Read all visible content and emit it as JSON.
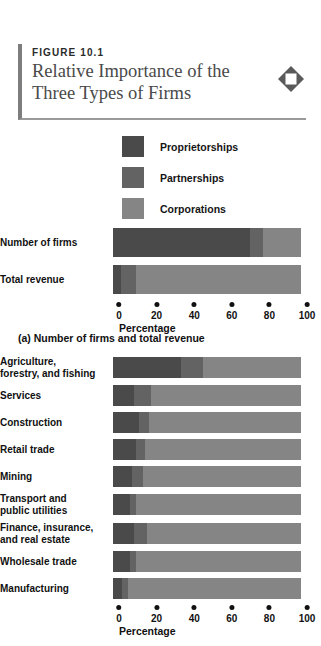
{
  "figure": {
    "label": "FIGURE 10.1",
    "title_line1": "Relative Importance of the",
    "title_line2": "Three Types of Firms",
    "icon": "diamond-icon"
  },
  "colors": {
    "proprietorships": "#4a4a4a",
    "partnerships": "#636363",
    "corporations": "#858585",
    "rule": "#7d7d7d",
    "text": "#111111"
  },
  "legend": {
    "items": [
      {
        "label": "Proprietorships",
        "color": "#4a4a4a"
      },
      {
        "label": "Partnerships",
        "color": "#636363"
      },
      {
        "label": "Corporations",
        "color": "#858585"
      }
    ]
  },
  "axis": {
    "ticks": [
      "0",
      "20",
      "40",
      "60",
      "80",
      "100"
    ],
    "tick_values": [
      0,
      20,
      40,
      60,
      80,
      100
    ],
    "title": "Percentage",
    "min": 0,
    "max": 100
  },
  "panel_a": {
    "caption": "(a) Number of firms and total revenue"
  },
  "chart_data": [
    {
      "type": "bar",
      "orientation": "horizontal",
      "stacked": true,
      "title": "(a) Number of firms and total revenue",
      "xlabel": "Percentage",
      "ylabel": "",
      "xlim": [
        0,
        100
      ],
      "grid": false,
      "legend_position": "top",
      "categories": [
        "Number of firms",
        "Total revenue"
      ],
      "series": [
        {
          "name": "Proprietorships",
          "values": [
            73,
            4
          ]
        },
        {
          "name": "Partnerships",
          "values": [
            7,
            8
          ]
        },
        {
          "name": "Corporations",
          "values": [
            20,
            88
          ]
        }
      ]
    },
    {
      "type": "bar",
      "orientation": "horizontal",
      "stacked": true,
      "title": "",
      "xlabel": "Percentage",
      "ylabel": "",
      "xlim": [
        0,
        100
      ],
      "grid": false,
      "legend_position": "top",
      "categories": [
        "Agriculture,\nforestry, and fishing",
        "Services",
        "Construction",
        "Retail trade",
        "Mining",
        "Transport and\npublic utilities",
        "Finance, insurance,\nand real estate",
        "Wholesale trade",
        "Manufacturing"
      ],
      "series": [
        {
          "name": "Proprietorships",
          "values": [
            36,
            11,
            14,
            12,
            10,
            9,
            11,
            9,
            5
          ]
        },
        {
          "name": "Partnerships",
          "values": [
            12,
            9,
            5,
            5,
            6,
            3,
            7,
            3,
            3
          ]
        },
        {
          "name": "Corporations",
          "values": [
            52,
            80,
            81,
            83,
            84,
            88,
            82,
            88,
            92
          ]
        }
      ]
    }
  ]
}
